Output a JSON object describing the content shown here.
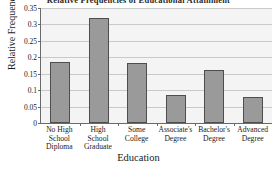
{
  "chart_data": {
    "type": "bar",
    "title": "Relative Frequencies of Educational Attainment",
    "xlabel": "Education",
    "ylabel": "Relative Frequency",
    "categories": [
      "No High School Diploma",
      "High School Graduate",
      "Some College",
      "Associate's Degree",
      "Bachelor's Degree",
      "Advanced Degree"
    ],
    "category_lines": [
      [
        "No High",
        "School",
        "Diploma"
      ],
      [
        "High School",
        "Graduate"
      ],
      [
        "Some",
        "College"
      ],
      [
        "Associate's",
        "Degree"
      ],
      [
        "Bachelor's",
        "Degree"
      ],
      [
        "Advanced",
        "Degree"
      ]
    ],
    "values": [
      0.185,
      0.32,
      0.182,
      0.085,
      0.16,
      0.08
    ],
    "ylim": [
      0,
      0.35
    ],
    "yticks": [
      0,
      0.05,
      0.1,
      0.15,
      0.2,
      0.25,
      0.3,
      0.35
    ],
    "ytick_labels": [
      "0",
      "0.05",
      "0.1",
      "0.15",
      "0.2",
      "0.25",
      "0.3",
      "0.35"
    ],
    "grid": true,
    "legend": null,
    "colors": {
      "bar_fill": "#9a9a9a",
      "bar_edge": "#4e4e4e",
      "grid": "#c9c9c9",
      "axis": "#6a6a6a",
      "plot_background": "#f4f4f4",
      "figure_background": "#ffffff",
      "text": "#1a1a1a"
    }
  }
}
